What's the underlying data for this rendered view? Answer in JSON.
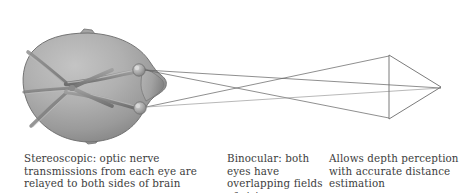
{
  "figure": {
    "background_color": "#ffffff"
  },
  "illustration": {
    "subject": "top-down view of a head showing optic nerves crossing at the optic chiasm, with lines of sight from both eyes converging on a triangular object",
    "parts": [
      {
        "name": "head-outline",
        "label": "head (superior view)"
      },
      {
        "name": "optic-nerve-left",
        "label": "left optic nerve"
      },
      {
        "name": "optic-nerve-right",
        "label": "right optic nerve"
      },
      {
        "name": "optic-chiasm",
        "label": "optic chiasm (crossing point)"
      },
      {
        "name": "eye-upper",
        "label": "eye"
      },
      {
        "name": "eye-lower",
        "label": "eye"
      },
      {
        "name": "sight-line-upper",
        "label": "line of sight from upper eye"
      },
      {
        "name": "sight-line-lower",
        "label": "line of sight from lower eye"
      },
      {
        "name": "target-object",
        "label": "triangular target object"
      }
    ],
    "colors": {
      "head_fill_light": "#b9b9b9",
      "head_fill_mid": "#9d9d9d",
      "head_fill_dark": "#7e7e7e",
      "head_outline": "#6a6a6a",
      "nerve_color": "#8a8a8a",
      "nerve_shadow": "#6f6f6f",
      "eye_highlight": "#d3d3d3",
      "sight_line": "#5a5a5a",
      "object_outline": "#6b6b6b"
    }
  },
  "captions": {
    "stereoscopic": "Stereoscopic: optic nerve transmissions from each eye are relayed to both sides of brain",
    "binocular": "Binocular: both eyes have overlapping fields of vision",
    "depth": "Allows depth perception with accurate distance estimation"
  }
}
